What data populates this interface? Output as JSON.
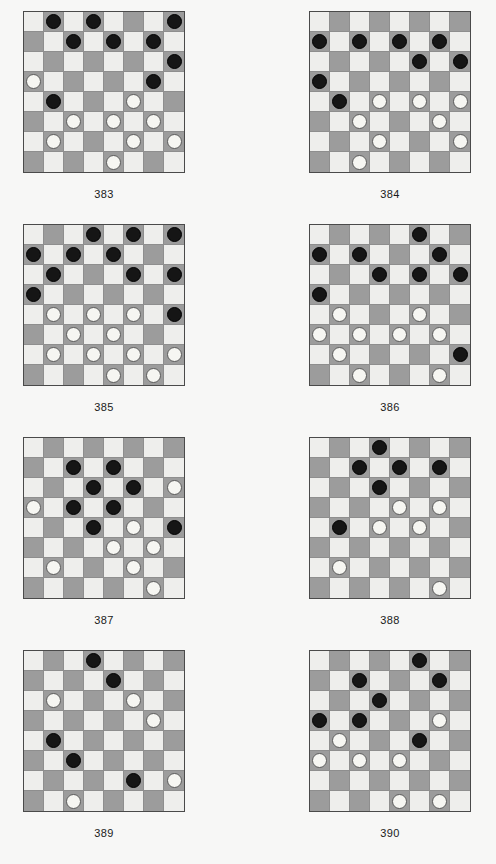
{
  "page": {
    "background_color": "#f7f7f6",
    "dark_square_color": "#9c9c9c",
    "light_square_color": "#eeeeec",
    "black_piece_color": "#151515",
    "white_piece_color": "#f6f6f2",
    "board_size": 8,
    "columns": 2,
    "rows": 4
  },
  "diagrams": [
    {
      "label": "383",
      "x": 23,
      "y": 11,
      "pieces": [
        {
          "row": 0,
          "col": 1,
          "color": "black"
        },
        {
          "row": 0,
          "col": 3,
          "color": "black"
        },
        {
          "row": 0,
          "col": 7,
          "color": "black"
        },
        {
          "row": 1,
          "col": 2,
          "color": "black"
        },
        {
          "row": 1,
          "col": 4,
          "color": "black"
        },
        {
          "row": 1,
          "col": 6,
          "color": "black"
        },
        {
          "row": 2,
          "col": 7,
          "color": "black"
        },
        {
          "row": 3,
          "col": 0,
          "color": "white"
        },
        {
          "row": 3,
          "col": 6,
          "color": "black"
        },
        {
          "row": 4,
          "col": 1,
          "color": "black"
        },
        {
          "row": 4,
          "col": 5,
          "color": "white"
        },
        {
          "row": 5,
          "col": 2,
          "color": "white"
        },
        {
          "row": 5,
          "col": 4,
          "color": "white"
        },
        {
          "row": 5,
          "col": 6,
          "color": "white"
        },
        {
          "row": 6,
          "col": 1,
          "color": "white"
        },
        {
          "row": 6,
          "col": 5,
          "color": "white"
        },
        {
          "row": 6,
          "col": 7,
          "color": "white"
        },
        {
          "row": 7,
          "col": 4,
          "color": "white"
        }
      ]
    },
    {
      "label": "384",
      "x": 309,
      "y": 11,
      "pieces": [
        {
          "row": 1,
          "col": 0,
          "color": "black"
        },
        {
          "row": 1,
          "col": 2,
          "color": "black"
        },
        {
          "row": 1,
          "col": 4,
          "color": "black"
        },
        {
          "row": 1,
          "col": 6,
          "color": "black"
        },
        {
          "row": 2,
          "col": 5,
          "color": "black"
        },
        {
          "row": 2,
          "col": 7,
          "color": "black"
        },
        {
          "row": 3,
          "col": 0,
          "color": "black"
        },
        {
          "row": 4,
          "col": 1,
          "color": "black"
        },
        {
          "row": 4,
          "col": 3,
          "color": "white"
        },
        {
          "row": 4,
          "col": 5,
          "color": "white"
        },
        {
          "row": 4,
          "col": 7,
          "color": "white"
        },
        {
          "row": 5,
          "col": 2,
          "color": "white"
        },
        {
          "row": 5,
          "col": 6,
          "color": "white"
        },
        {
          "row": 6,
          "col": 3,
          "color": "white"
        },
        {
          "row": 6,
          "col": 7,
          "color": "white"
        },
        {
          "row": 7,
          "col": 2,
          "color": "white"
        }
      ]
    },
    {
      "label": "385",
      "x": 23,
      "y": 224,
      "pieces": [
        {
          "row": 0,
          "col": 3,
          "color": "black"
        },
        {
          "row": 0,
          "col": 5,
          "color": "black"
        },
        {
          "row": 0,
          "col": 7,
          "color": "black"
        },
        {
          "row": 1,
          "col": 0,
          "color": "black"
        },
        {
          "row": 1,
          "col": 2,
          "color": "black"
        },
        {
          "row": 1,
          "col": 4,
          "color": "black"
        },
        {
          "row": 2,
          "col": 1,
          "color": "black"
        },
        {
          "row": 2,
          "col": 5,
          "color": "black"
        },
        {
          "row": 2,
          "col": 7,
          "color": "black"
        },
        {
          "row": 3,
          "col": 0,
          "color": "black"
        },
        {
          "row": 4,
          "col": 1,
          "color": "white"
        },
        {
          "row": 4,
          "col": 3,
          "color": "white"
        },
        {
          "row": 4,
          "col": 5,
          "color": "white"
        },
        {
          "row": 4,
          "col": 7,
          "color": "black"
        },
        {
          "row": 5,
          "col": 2,
          "color": "white"
        },
        {
          "row": 5,
          "col": 4,
          "color": "white"
        },
        {
          "row": 6,
          "col": 1,
          "color": "white"
        },
        {
          "row": 6,
          "col": 3,
          "color": "white"
        },
        {
          "row": 6,
          "col": 5,
          "color": "white"
        },
        {
          "row": 6,
          "col": 7,
          "color": "white"
        },
        {
          "row": 7,
          "col": 4,
          "color": "white"
        },
        {
          "row": 7,
          "col": 6,
          "color": "white"
        }
      ]
    },
    {
      "label": "386",
      "x": 309,
      "y": 224,
      "pieces": [
        {
          "row": 0,
          "col": 5,
          "color": "black"
        },
        {
          "row": 1,
          "col": 0,
          "color": "black"
        },
        {
          "row": 1,
          "col": 2,
          "color": "black"
        },
        {
          "row": 1,
          "col": 6,
          "color": "black"
        },
        {
          "row": 2,
          "col": 3,
          "color": "black"
        },
        {
          "row": 2,
          "col": 5,
          "color": "black"
        },
        {
          "row": 2,
          "col": 7,
          "color": "black"
        },
        {
          "row": 3,
          "col": 0,
          "color": "black"
        },
        {
          "row": 4,
          "col": 1,
          "color": "white"
        },
        {
          "row": 4,
          "col": 5,
          "color": "white"
        },
        {
          "row": 5,
          "col": 0,
          "color": "white"
        },
        {
          "row": 5,
          "col": 2,
          "color": "white"
        },
        {
          "row": 5,
          "col": 4,
          "color": "white"
        },
        {
          "row": 5,
          "col": 6,
          "color": "white"
        },
        {
          "row": 6,
          "col": 1,
          "color": "white"
        },
        {
          "row": 6,
          "col": 7,
          "color": "black"
        },
        {
          "row": 7,
          "col": 2,
          "color": "white"
        },
        {
          "row": 7,
          "col": 6,
          "color": "white"
        }
      ]
    },
    {
      "label": "387",
      "x": 23,
      "y": 437,
      "pieces": [
        {
          "row": 1,
          "col": 2,
          "color": "black"
        },
        {
          "row": 1,
          "col": 4,
          "color": "black"
        },
        {
          "row": 2,
          "col": 3,
          "color": "black"
        },
        {
          "row": 2,
          "col": 5,
          "color": "black"
        },
        {
          "row": 2,
          "col": 7,
          "color": "white"
        },
        {
          "row": 3,
          "col": 0,
          "color": "white"
        },
        {
          "row": 3,
          "col": 2,
          "color": "black"
        },
        {
          "row": 3,
          "col": 4,
          "color": "black"
        },
        {
          "row": 4,
          "col": 3,
          "color": "black"
        },
        {
          "row": 4,
          "col": 5,
          "color": "white"
        },
        {
          "row": 4,
          "col": 7,
          "color": "black"
        },
        {
          "row": 5,
          "col": 4,
          "color": "white"
        },
        {
          "row": 5,
          "col": 6,
          "color": "white"
        },
        {
          "row": 6,
          "col": 1,
          "color": "white"
        },
        {
          "row": 6,
          "col": 5,
          "color": "white"
        },
        {
          "row": 7,
          "col": 6,
          "color": "white"
        }
      ]
    },
    {
      "label": "388",
      "x": 309,
      "y": 437,
      "pieces": [
        {
          "row": 0,
          "col": 3,
          "color": "black"
        },
        {
          "row": 1,
          "col": 2,
          "color": "black"
        },
        {
          "row": 1,
          "col": 4,
          "color": "black"
        },
        {
          "row": 1,
          "col": 6,
          "color": "black"
        },
        {
          "row": 2,
          "col": 3,
          "color": "black"
        },
        {
          "row": 3,
          "col": 4,
          "color": "white"
        },
        {
          "row": 3,
          "col": 6,
          "color": "white"
        },
        {
          "row": 4,
          "col": 1,
          "color": "black"
        },
        {
          "row": 4,
          "col": 3,
          "color": "white"
        },
        {
          "row": 4,
          "col": 5,
          "color": "white"
        },
        {
          "row": 6,
          "col": 1,
          "color": "white"
        },
        {
          "row": 7,
          "col": 6,
          "color": "white"
        }
      ]
    },
    {
      "label": "389",
      "x": 23,
      "y": 650,
      "pieces": [
        {
          "row": 0,
          "col": 3,
          "color": "black"
        },
        {
          "row": 1,
          "col": 4,
          "color": "black"
        },
        {
          "row": 2,
          "col": 1,
          "color": "white"
        },
        {
          "row": 2,
          "col": 5,
          "color": "white"
        },
        {
          "row": 3,
          "col": 6,
          "color": "white"
        },
        {
          "row": 4,
          "col": 1,
          "color": "black"
        },
        {
          "row": 5,
          "col": 2,
          "color": "black"
        },
        {
          "row": 6,
          "col": 5,
          "color": "black"
        },
        {
          "row": 6,
          "col": 7,
          "color": "white"
        },
        {
          "row": 7,
          "col": 2,
          "color": "white"
        }
      ]
    },
    {
      "label": "390",
      "x": 309,
      "y": 650,
      "pieces": [
        {
          "row": 0,
          "col": 5,
          "color": "black"
        },
        {
          "row": 1,
          "col": 2,
          "color": "black"
        },
        {
          "row": 1,
          "col": 6,
          "color": "black"
        },
        {
          "row": 2,
          "col": 3,
          "color": "black"
        },
        {
          "row": 3,
          "col": 0,
          "color": "black"
        },
        {
          "row": 3,
          "col": 2,
          "color": "black"
        },
        {
          "row": 3,
          "col": 6,
          "color": "white"
        },
        {
          "row": 4,
          "col": 1,
          "color": "white"
        },
        {
          "row": 4,
          "col": 5,
          "color": "black"
        },
        {
          "row": 5,
          "col": 0,
          "color": "white"
        },
        {
          "row": 5,
          "col": 2,
          "color": "white"
        },
        {
          "row": 5,
          "col": 4,
          "color": "white"
        },
        {
          "row": 7,
          "col": 4,
          "color": "white"
        },
        {
          "row": 7,
          "col": 6,
          "color": "white"
        }
      ]
    }
  ]
}
